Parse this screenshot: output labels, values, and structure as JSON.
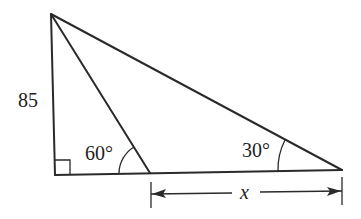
{
  "diagram": {
    "type": "triangle-trigonometry",
    "labels": {
      "side_height": "85",
      "angle_inner": "60°",
      "angle_right": "30°",
      "unknown_segment": "x"
    },
    "points": {
      "apex": [
        51,
        14
      ],
      "right_angle_corner": [
        55,
        175
      ],
      "inner_point": [
        150,
        173
      ],
      "right_vertex": [
        342,
        170
      ]
    },
    "colors": {
      "stroke": "#2a2a2a",
      "text": "#1e1e1e",
      "background": "#ffffff"
    }
  }
}
